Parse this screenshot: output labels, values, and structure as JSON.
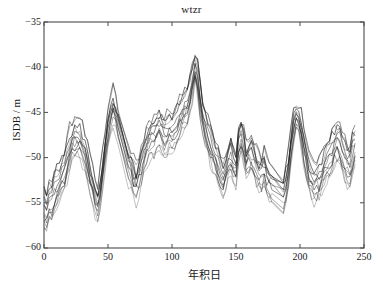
{
  "chart_data": {
    "type": "line",
    "title": "wtzr",
    "xlabel": "年积日",
    "ylabel": "ISDB / m",
    "xlim": [
      0,
      250
    ],
    "ylim": [
      -60,
      -35
    ],
    "xticks": [
      0,
      50,
      100,
      150,
      200,
      250
    ],
    "yticks": [
      -35,
      -40,
      -45,
      -50,
      -55,
      -60
    ],
    "xtick_labels": [
      "0",
      "50",
      "100",
      "150",
      "200",
      "250"
    ],
    "ytick_labels": [
      "−35",
      "−40",
      "−45",
      "−50",
      "−55",
      "−60"
    ],
    "grid": false,
    "legend": "none",
    "line_color": "#1a1a1a",
    "background_color": "#ffffff",
    "axis_color": "#444444",
    "n_series": 13,
    "x": [
      0,
      2,
      4,
      6,
      8,
      10,
      12,
      14,
      16,
      18,
      20,
      22,
      24,
      26,
      28,
      30,
      32,
      34,
      36,
      38,
      40,
      42,
      44,
      46,
      48,
      50,
      52,
      54,
      56,
      58,
      66,
      68,
      70,
      72,
      74,
      76,
      78,
      80,
      82,
      84,
      86,
      88,
      90,
      92,
      94,
      96,
      98,
      100,
      102,
      104,
      106,
      108,
      110,
      112,
      114,
      116,
      118,
      120,
      122,
      124,
      126,
      128,
      130,
      132,
      134,
      136,
      138,
      140,
      142,
      144,
      146,
      148,
      150,
      152,
      154,
      156,
      158,
      160,
      162,
      164,
      166,
      168,
      170,
      172,
      174,
      176,
      178,
      187,
      189,
      191,
      193,
      195,
      197,
      199,
      201,
      203,
      205,
      207,
      209,
      211,
      213,
      215,
      217,
      219,
      221,
      223,
      225,
      227,
      229,
      231,
      233,
      235,
      237,
      239,
      241,
      243
    ],
    "series": [
      {
        "name": "trace-mean",
        "values": [
          -55.4,
          -55.8,
          -54.6,
          -54.9,
          -53.8,
          -53.2,
          -52.6,
          -51.9,
          -51.4,
          -50.2,
          -49.1,
          -48.3,
          -47.9,
          -47.6,
          -47.8,
          -48.6,
          -49.4,
          -50.6,
          -51.8,
          -52.9,
          -54.3,
          -55.0,
          -53.4,
          -51.2,
          -49.0,
          -46.8,
          -45.4,
          -44.6,
          -45.2,
          -46.6,
          -51.0,
          -51.5,
          -52.4,
          -53.0,
          -52.2,
          -51.0,
          -49.9,
          -48.9,
          -48.4,
          -48.0,
          -47.7,
          -47.2,
          -46.8,
          -47.3,
          -47.9,
          -47.5,
          -47.0,
          -47.4,
          -46.9,
          -46.2,
          -45.5,
          -45.0,
          -44.6,
          -44.0,
          -43.0,
          -41.5,
          -39.6,
          -41.0,
          -43.4,
          -45.4,
          -46.6,
          -47.4,
          -48.3,
          -49.3,
          -50.1,
          -50.9,
          -51.7,
          -52.3,
          -51.5,
          -50.3,
          -49.7,
          -50.8,
          -51.5,
          -48.6,
          -47.4,
          -48.6,
          -50.4,
          -49.9,
          -49.6,
          -50.2,
          -51.1,
          -51.7,
          -52.0,
          -51.1,
          -52.2,
          -52.8,
          -53.0,
          -54.3,
          -53.0,
          -51.1,
          -48.6,
          -46.6,
          -45.3,
          -45.6,
          -47.0,
          -48.9,
          -50.3,
          -51.5,
          -52.4,
          -52.8,
          -52.6,
          -52.2,
          -51.6,
          -51.0,
          -50.4,
          -49.9,
          -49.3,
          -48.6,
          -48.2,
          -48.4,
          -49.3,
          -50.2,
          -50.8,
          -51.0,
          -49.6,
          -48.7
        ]
      },
      {
        "name": "trace-upper-envelope",
        "values": [
          -53.6,
          -54.4,
          -53.2,
          -53.1,
          -52.0,
          -51.4,
          -50.9,
          -50.2,
          -49.6,
          -48.3,
          -47.3,
          -46.6,
          -46.2,
          -46.0,
          -46.1,
          -46.9,
          -47.6,
          -48.9,
          -50.1,
          -51.2,
          -52.6,
          -53.2,
          -51.6,
          -49.4,
          -47.2,
          -45.0,
          -43.6,
          -42.8,
          -43.5,
          -45.0,
          -49.3,
          -49.8,
          -50.7,
          -51.2,
          -50.5,
          -49.3,
          -48.2,
          -47.2,
          -46.7,
          -46.3,
          -46.0,
          -45.6,
          -45.1,
          -45.6,
          -46.2,
          -45.8,
          -45.3,
          -45.7,
          -45.2,
          -44.5,
          -43.8,
          -43.3,
          -42.9,
          -42.3,
          -41.3,
          -39.9,
          -38.9,
          -39.4,
          -41.7,
          -43.7,
          -44.9,
          -45.7,
          -46.6,
          -47.6,
          -48.4,
          -49.2,
          -50.0,
          -50.6,
          -49.8,
          -48.6,
          -48.0,
          -49.1,
          -49.8,
          -46.9,
          -45.8,
          -46.9,
          -48.7,
          -48.2,
          -47.9,
          -48.5,
          -49.4,
          -50.0,
          -50.3,
          -49.4,
          -50.5,
          -51.1,
          -51.3,
          -52.6,
          -51.3,
          -49.4,
          -46.9,
          -45.0,
          -44.6,
          -44.9,
          -45.4,
          -47.2,
          -48.6,
          -49.8,
          -50.7,
          -51.1,
          -50.9,
          -50.5,
          -49.9,
          -49.3,
          -48.7,
          -48.2,
          -47.6,
          -47.0,
          -46.6,
          -46.8,
          -47.6,
          -48.5,
          -49.1,
          -49.3,
          -48.0,
          -47.1
        ]
      },
      {
        "name": "trace-lower-envelope",
        "values": [
          -57.2,
          -57.6,
          -56.3,
          -56.6,
          -55.5,
          -55.0,
          -54.3,
          -53.6,
          -53.1,
          -51.9,
          -50.8,
          -50.0,
          -49.6,
          -49.3,
          -49.5,
          -50.3,
          -51.1,
          -52.3,
          -53.5,
          -54.6,
          -56.0,
          -56.8,
          -55.1,
          -52.9,
          -50.7,
          -48.5,
          -47.1,
          -46.3,
          -46.9,
          -48.3,
          -52.7,
          -53.2,
          -54.1,
          -54.7,
          -53.9,
          -52.7,
          -51.6,
          -50.6,
          -50.1,
          -49.7,
          -49.4,
          -48.9,
          -48.5,
          -49.0,
          -49.6,
          -49.2,
          -48.7,
          -49.1,
          -48.6,
          -47.9,
          -47.2,
          -46.7,
          -46.3,
          -45.7,
          -44.7,
          -43.2,
          -41.3,
          -42.7,
          -45.1,
          -47.1,
          -48.3,
          -49.1,
          -50.0,
          -51.0,
          -51.8,
          -52.6,
          -53.4,
          -54.0,
          -53.2,
          -52.0,
          -51.4,
          -52.5,
          -53.2,
          -50.3,
          -49.1,
          -50.3,
          -52.1,
          -51.6,
          -51.3,
          -51.9,
          -52.8,
          -53.4,
          -53.7,
          -52.8,
          -53.9,
          -54.5,
          -54.7,
          -56.0,
          -54.7,
          -52.8,
          -50.3,
          -48.3,
          -46.6,
          -46.9,
          -48.4,
          -50.6,
          -52.0,
          -53.2,
          -54.1,
          -54.6,
          -54.4,
          -54.0,
          -53.4,
          -52.8,
          -52.2,
          -51.7,
          -51.1,
          -50.3,
          -49.9,
          -50.1,
          -51.0,
          -51.9,
          -52.5,
          -52.7,
          -51.3,
          -50.4
        ]
      }
    ]
  }
}
